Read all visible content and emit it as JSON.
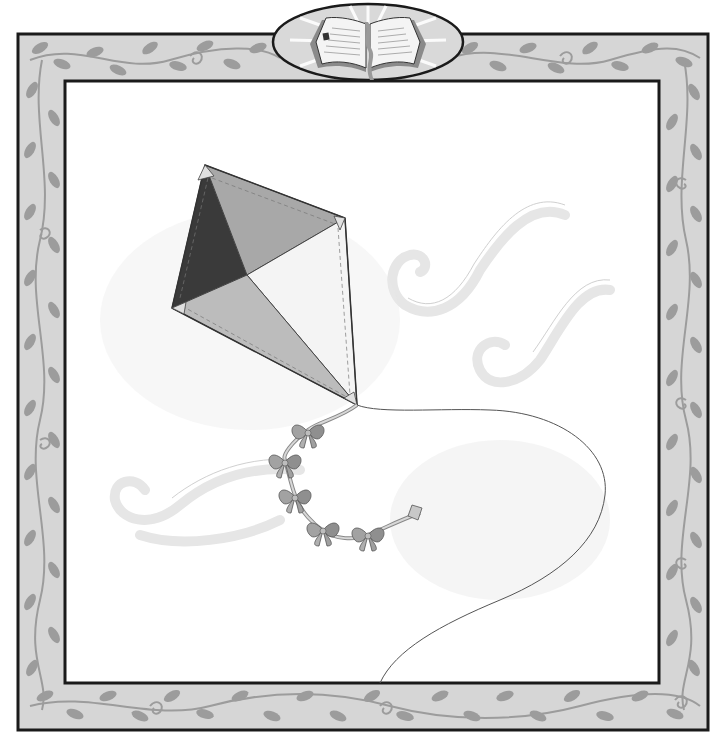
{
  "illustration": {
    "subject": "kite with bow tail flying in the wind",
    "colors": {
      "background": "#ffffff",
      "frame_fill": "#d6d6d6",
      "frame_leaf": "#9c9c9c",
      "frame_stroke": "#1a1a1a",
      "kite_dark": "#3a3a3a",
      "kite_mid": "#a8a8a8",
      "kite_light": "#f2f2f2",
      "kite_bottom": "#bcbcbc",
      "bow": "#9a9a9a",
      "string": "#555555",
      "wind": "#ececec"
    }
  },
  "emblem": {
    "icon": "open-book-icon"
  }
}
